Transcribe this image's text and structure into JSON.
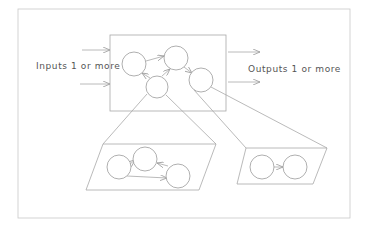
{
  "diagram": {
    "type": "system-decomposition",
    "labels": {
      "inputs": "Inputs 1 or more",
      "outputs": "Outputs 1 or more"
    },
    "colors": {
      "line": "#a8a8a8",
      "frame": "#c8c8c8",
      "text": "#555555",
      "background": "#ffffff"
    },
    "main_box": {
      "nodes": 4,
      "edges": [
        [
          "n1",
          "n2"
        ],
        [
          "n3",
          "n1"
        ],
        [
          "n3",
          "n2"
        ],
        [
          "n2",
          "n4"
        ]
      ]
    },
    "subsystem_left": {
      "nodes": 3,
      "edges": [
        [
          "n1",
          "n2"
        ],
        [
          "n1",
          "n3"
        ],
        [
          "n3",
          "n2"
        ]
      ]
    },
    "subsystem_right": {
      "nodes": 2,
      "edges": [
        [
          "n1",
          "n2"
        ]
      ]
    },
    "input_arrows": 2,
    "output_arrows": 2
  }
}
